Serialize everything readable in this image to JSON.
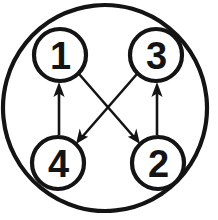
{
  "diagram": {
    "background_color": "#ffffff",
    "stroke_color": "#141414",
    "outer_circle": {
      "name": "outer-boundary-circle",
      "cx": 105,
      "cy": 108,
      "rx": 102,
      "ry": 103,
      "rotation": -6,
      "stroke_width": 4.2
    },
    "nodes": [
      {
        "id": "node-1",
        "label": "1",
        "cx": 60,
        "cy": 55,
        "r": 26,
        "stroke_width": 4.2,
        "position": "top-left"
      },
      {
        "id": "node-3",
        "label": "3",
        "cx": 156,
        "cy": 55,
        "r": 26,
        "stroke_width": 4.2,
        "position": "top-right"
      },
      {
        "id": "node-4",
        "label": "4",
        "cx": 58,
        "cy": 163,
        "r": 26,
        "stroke_width": 4.2,
        "position": "bottom-left"
      },
      {
        "id": "node-2",
        "label": "2",
        "cx": 158,
        "cy": 163,
        "r": 26,
        "stroke_width": 4.2,
        "position": "bottom-right"
      }
    ],
    "arrows": [
      {
        "id": "arrow-4-to-1",
        "from": "4",
        "to": "1",
        "x1": 59,
        "y1": 135,
        "x2": 59,
        "y2": 84,
        "orientation": "vertical-up",
        "stroke_width": 2.6
      },
      {
        "id": "arrow-2-to-3",
        "from": "2",
        "to": "3",
        "x1": 157,
        "y1": 135,
        "x2": 157,
        "y2": 84,
        "orientation": "vertical-up",
        "stroke_width": 2.6
      },
      {
        "id": "arrow-1-to-2",
        "from": "1",
        "to": "2",
        "x1": 79,
        "y1": 74,
        "x2": 139,
        "y2": 142,
        "orientation": "diagonal-down-right",
        "stroke_width": 2.6
      },
      {
        "id": "arrow-3-to-4",
        "from": "3",
        "to": "4",
        "x1": 137,
        "y1": 74,
        "x2": 77,
        "y2": 142,
        "orientation": "diagonal-down-left",
        "stroke_width": 2.6
      }
    ]
  }
}
